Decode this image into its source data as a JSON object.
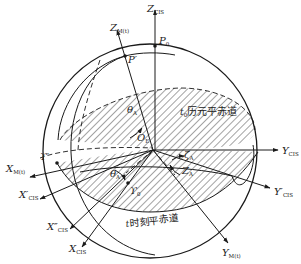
{
  "diagram": {
    "colors": {
      "line": "#1a1a1a",
      "background": "#ffffff",
      "hatch": "#333333"
    },
    "planes": {
      "epoch_mean_equator": "t₀历元平赤道",
      "epoch_mean_equator_t": "t",
      "epoch_mean_equator_sub": "0",
      "epoch_mean_equator_rest": "历元平赤道",
      "date_mean_equator_t": "t",
      "date_mean_equator_rest": "时刻平赤道"
    },
    "points": {
      "P0": {
        "main": "P",
        "sub": "0"
      },
      "Pprime": {
        "main": "P′"
      },
      "origin": {
        "main": "O",
        "sub": "E"
      },
      "gamma": {
        "main": "ϒ′"
      },
      "gamma0": {
        "main": "ϒ",
        "sub": "0"
      }
    },
    "axes": {
      "Z_CIS": {
        "main": "Z",
        "sub": "CIS"
      },
      "Z_Mt": {
        "main": "Z",
        "sub": "M(t)"
      },
      "Y_CIS": {
        "main": "Y",
        "sub": "CIS"
      },
      "Y_CIS_prime": {
        "main": "Y′",
        "sub": "CIS"
      },
      "Y_Mt": {
        "main": "Y",
        "sub": "M(t)"
      },
      "X_Mt": {
        "main": "X",
        "sub": "M(t)"
      },
      "X_CIS_prime": {
        "main": "X′",
        "sub": "CIS"
      },
      "X_CIS_dprime": {
        "main": "X″",
        "sub": "CIS"
      },
      "X_CIS": {
        "main": "X",
        "sub": "CIS"
      }
    },
    "angles": {
      "theta_A_top": {
        "main": "θ",
        "sub": "A"
      },
      "theta_A_bottom": {
        "main": "θ",
        "sub": "A"
      },
      "zeta_A": {
        "main": "ζ",
        "sub": "A"
      },
      "Z_A": {
        "main": "Z",
        "sub": "A"
      }
    }
  }
}
